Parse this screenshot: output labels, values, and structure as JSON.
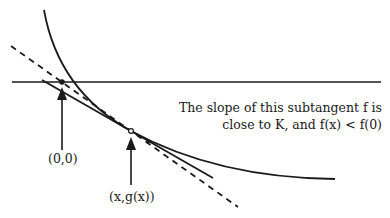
{
  "diagram": {
    "labels": {
      "origin": "(0,0)",
      "tangent_point": "(x,g(x))"
    },
    "caption": {
      "line1": "The slope of this subtangent f  is",
      "line2": "close to K, and f(x) < f(0)"
    },
    "colors": {
      "stroke": "#1a1a1a",
      "background": "#ffffff"
    }
  }
}
